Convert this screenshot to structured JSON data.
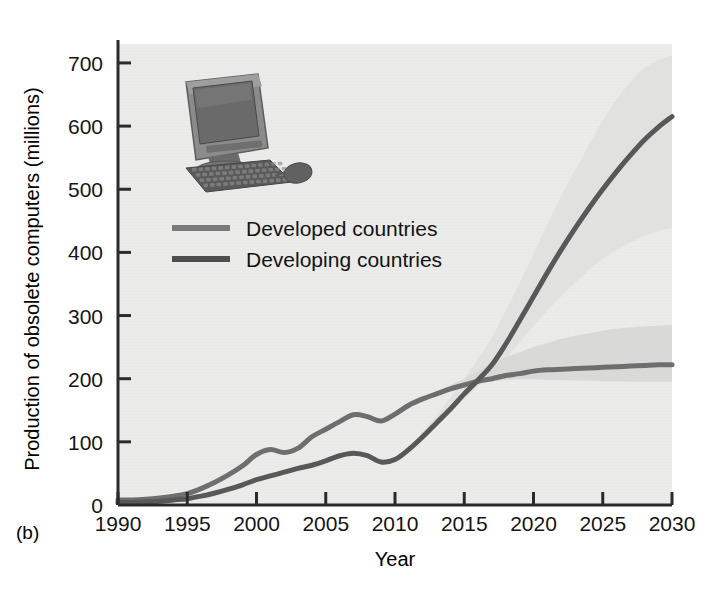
{
  "figure": {
    "panel_label": "(b)",
    "background_color": "#ffffff",
    "plot_background_color": "#e9e9e7"
  },
  "inset_image": {
    "name": "crt-computer-photo",
    "description": "Photograph of an obsolete CRT desktop computer with keyboard and mouse",
    "monitor_color": "#8b8b8b",
    "screen_color": "#6a6a6a",
    "keyboard_color": "#555555"
  },
  "chart_data": {
    "type": "line",
    "title": "",
    "xlabel": "Year",
    "ylabel": "Production of obsolete computers (millions)",
    "xlim": [
      1990,
      2030
    ],
    "ylim": [
      0,
      730
    ],
    "xticks": [
      1990,
      1995,
      2000,
      2005,
      2010,
      2015,
      2020,
      2025,
      2030
    ],
    "yticks": [
      0,
      100,
      200,
      300,
      400,
      500,
      600,
      700
    ],
    "xtick_labels": [
      "1990",
      "1995",
      "2000",
      "2005",
      "2010",
      "2015",
      "2020",
      "2025",
      "2030"
    ],
    "ytick_labels": [
      "0",
      "100",
      "200",
      "300",
      "400",
      "500",
      "600",
      "700"
    ],
    "grid": false,
    "legend_position": "upper-left-inside",
    "x": [
      1990,
      1991,
      1992,
      1993,
      1994,
      1995,
      1996,
      1997,
      1998,
      1999,
      2000,
      2001,
      2002,
      2003,
      2004,
      2005,
      2006,
      2007,
      2008,
      2009,
      2010,
      2011,
      2012,
      2013,
      2014,
      2015,
      2016,
      2017,
      2018,
      2019,
      2020,
      2021,
      2022,
      2023,
      2024,
      2025,
      2026,
      2027,
      2028,
      2029,
      2030
    ],
    "series": [
      {
        "name": "Developed countries",
        "color": "#6e6e6e",
        "band_color": "#d8d8d6",
        "values": [
          8,
          8,
          9,
          11,
          14,
          18,
          26,
          36,
          48,
          62,
          80,
          88,
          83,
          90,
          108,
          120,
          132,
          143,
          140,
          133,
          144,
          158,
          168,
          176,
          184,
          190,
          196,
          200,
          205,
          208,
          212,
          214,
          215,
          216,
          217,
          218,
          219,
          220,
          221,
          222,
          222
        ],
        "band_low": [
          8,
          8,
          9,
          11,
          14,
          18,
          26,
          36,
          48,
          62,
          80,
          88,
          83,
          90,
          108,
          120,
          132,
          143,
          140,
          133,
          144,
          158,
          168,
          176,
          184,
          190,
          194,
          196,
          198,
          199,
          199,
          198,
          198,
          197,
          197,
          196,
          196,
          195,
          195,
          195,
          195
        ],
        "band_high": [
          8,
          8,
          9,
          11,
          14,
          18,
          26,
          36,
          48,
          62,
          80,
          88,
          83,
          90,
          108,
          120,
          132,
          143,
          140,
          133,
          144,
          158,
          170,
          180,
          190,
          200,
          212,
          224,
          234,
          242,
          250,
          257,
          263,
          268,
          272,
          276,
          279,
          281,
          283,
          284,
          285
        ]
      },
      {
        "name": "Developing countries",
        "color": "#585858",
        "band_color": "#e0e0de",
        "values": [
          4,
          4,
          5,
          6,
          8,
          10,
          14,
          19,
          25,
          32,
          40,
          46,
          52,
          58,
          63,
          70,
          78,
          82,
          78,
          68,
          72,
          88,
          108,
          130,
          152,
          176,
          198,
          222,
          255,
          292,
          330,
          368,
          404,
          438,
          470,
          500,
          528,
          554,
          578,
          598,
          615
        ],
        "band_low": [
          4,
          4,
          5,
          6,
          8,
          10,
          14,
          19,
          25,
          32,
          40,
          46,
          52,
          58,
          63,
          70,
          78,
          82,
          78,
          68,
          72,
          88,
          106,
          126,
          146,
          168,
          188,
          208,
          232,
          258,
          284,
          308,
          330,
          352,
          372,
          390,
          404,
          416,
          426,
          434,
          440
        ],
        "band_high": [
          4,
          4,
          5,
          6,
          8,
          10,
          14,
          19,
          25,
          32,
          40,
          46,
          52,
          58,
          63,
          70,
          78,
          82,
          78,
          68,
          74,
          92,
          116,
          142,
          170,
          200,
          232,
          266,
          308,
          352,
          398,
          444,
          488,
          530,
          570,
          608,
          642,
          670,
          692,
          704,
          712
        ]
      }
    ],
    "annotations": []
  },
  "legend": {
    "entries": [
      {
        "label": "Developed countries",
        "swatch_color": "#7a7a7a"
      },
      {
        "label": "Developing countries",
        "swatch_color": "#4e4e4e"
      }
    ]
  }
}
